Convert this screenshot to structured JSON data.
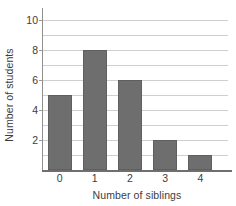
{
  "chart_data": {
    "type": "bar",
    "title": "",
    "xlabel": "Number of siblings",
    "ylabel": "Number of students",
    "categories": [
      "0",
      "1",
      "2",
      "3",
      "4"
    ],
    "values": [
      5,
      8,
      6,
      2,
      1
    ],
    "series": [
      {
        "name": "Number of students",
        "values": [
          5,
          8,
          6,
          2,
          1
        ]
      }
    ],
    "ylim": [
      0,
      10.5
    ],
    "xlim": [
      -0.5,
      4.9
    ],
    "yticks": [
      2,
      4,
      6,
      8,
      10
    ],
    "ytick_labels": [
      "2",
      "4",
      "6",
      "8",
      "10"
    ],
    "gridlines_at": [
      1,
      2,
      3,
      4,
      5,
      6,
      7,
      8,
      9,
      10
    ],
    "grid": true,
    "grid_axis": "y",
    "legend": "none",
    "bar_color": "#6e6e6e",
    "bar_edge_color": "#5f5f5f",
    "grid_color": "#cfcfcf",
    "axis_color": "#6f6f6f",
    "background_color": "#ffffff",
    "text_color": "#3c3c3c"
  }
}
